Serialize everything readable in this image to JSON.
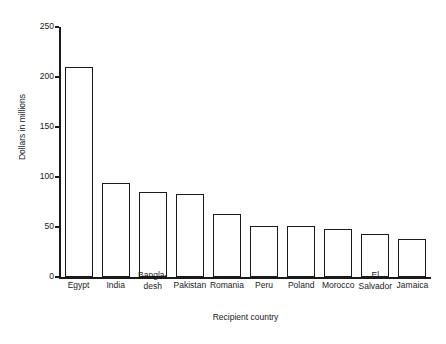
{
  "chart_data": {
    "type": "bar",
    "title": "",
    "xlabel": "Recipient country",
    "ylabel": "Dollars in millions",
    "categories": [
      "Egypt",
      "India",
      "Bangla-\ndesh",
      "Pakistan",
      "Romania",
      "Peru",
      "Poland",
      "Morocco",
      "El\nSalvador",
      "Jamaica"
    ],
    "values": [
      210,
      94,
      85,
      83,
      63,
      51,
      51,
      48,
      43,
      38
    ],
    "ylim": [
      0,
      250
    ],
    "yticks": [
      0,
      50,
      100,
      150,
      200,
      250
    ],
    "ytick_labels": [
      "0",
      "50",
      "100",
      "150",
      "200",
      "250"
    ],
    "grid": false,
    "legend": false,
    "bar_fill": "#ffffff",
    "bar_edge": "#1a1a1a",
    "axis_color": "#1a1a1a"
  }
}
